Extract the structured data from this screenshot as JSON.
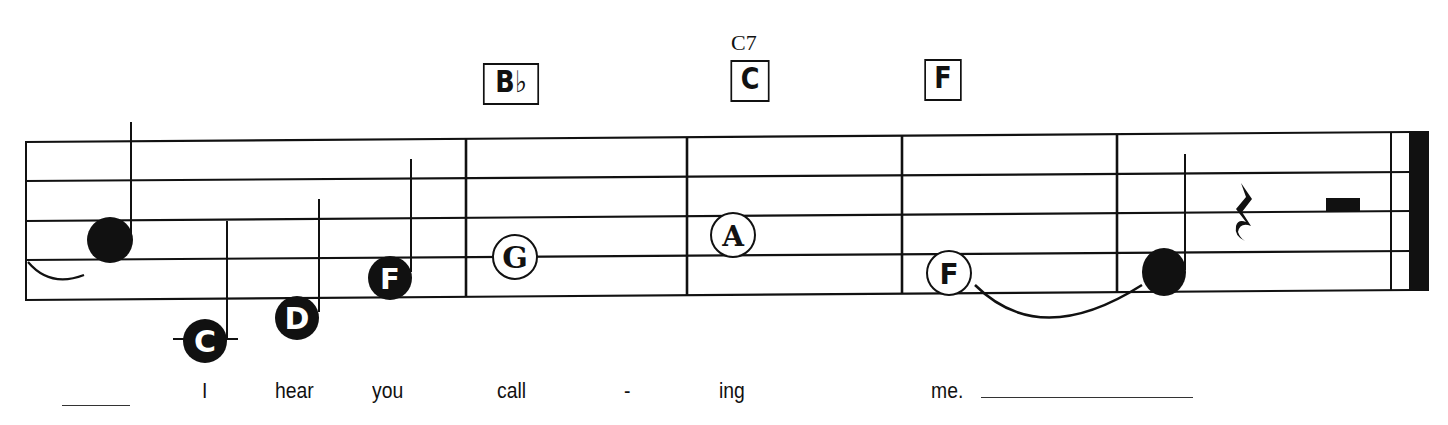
{
  "chords": [
    {
      "label": "B♭",
      "x": 478,
      "y": 63,
      "w": 62
    },
    {
      "label": "C",
      "x": 727,
      "y": 60,
      "w": 42,
      "superscript": "C7"
    },
    {
      "label": "F",
      "x": 921,
      "y": 59,
      "w": 40
    }
  ],
  "notes": [
    {
      "name": "",
      "style": "filled-large",
      "x": 110,
      "y": 240
    },
    {
      "name": "C",
      "style": "filled",
      "x": 205,
      "y": 340,
      "ledger": true
    },
    {
      "name": "D",
      "style": "filled",
      "x": 297,
      "y": 318
    },
    {
      "name": "F",
      "style": "filled",
      "x": 390,
      "y": 278
    },
    {
      "name": "G",
      "style": "open",
      "x": 515,
      "y": 257
    },
    {
      "name": "A",
      "style": "open",
      "x": 733,
      "y": 235
    },
    {
      "name": "F",
      "style": "open",
      "x": 949,
      "y": 273
    },
    {
      "name": "",
      "style": "filled-large",
      "x": 1164,
      "y": 272
    }
  ],
  "rests": [
    {
      "type": "quarter-rest",
      "x": 1244,
      "y": 215
    },
    {
      "type": "half-rest",
      "x": 1343,
      "y": 204
    }
  ],
  "lyrics": [
    {
      "text": "I",
      "x": 202
    },
    {
      "text": "hear",
      "x": 275
    },
    {
      "text": "you",
      "x": 372
    },
    {
      "text": "call",
      "x": 497
    },
    {
      "text": "-",
      "x": 624
    },
    {
      "text": "ing",
      "x": 719
    },
    {
      "text": "me.",
      "x": 931
    }
  ]
}
